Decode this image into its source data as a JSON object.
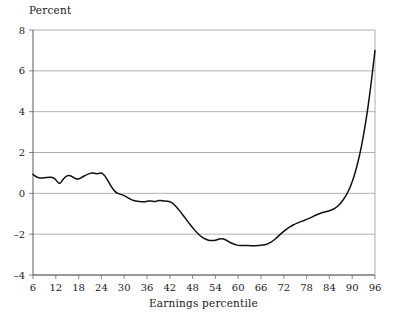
{
  "chart_data": {
    "type": "line",
    "title": "",
    "xlabel": "Earnings percentile",
    "ylabel": "Percent",
    "xlim": [
      6,
      96
    ],
    "ylim": [
      -4,
      8
    ],
    "xticks": [
      6,
      12,
      18,
      24,
      30,
      36,
      42,
      48,
      54,
      60,
      66,
      72,
      78,
      84,
      90,
      96
    ],
    "yticks": [
      -4,
      -2,
      0,
      2,
      4,
      6,
      8
    ],
    "grid": "horizontal",
    "legend": "none",
    "series": [
      {
        "name": "Percent change by earnings percentile",
        "x": [
          6,
          7,
          8,
          9,
          10,
          11,
          12,
          13,
          14,
          15,
          16,
          17,
          18,
          19,
          20,
          21,
          22,
          23,
          24,
          25,
          26,
          27,
          28,
          29,
          30,
          31,
          32,
          33,
          34,
          35,
          36,
          37,
          38,
          39,
          40,
          41,
          42,
          43,
          44,
          45,
          46,
          47,
          48,
          49,
          50,
          51,
          52,
          53,
          54,
          55,
          56,
          57,
          58,
          59,
          60,
          61,
          62,
          63,
          64,
          65,
          66,
          67,
          68,
          69,
          70,
          71,
          72,
          73,
          74,
          75,
          76,
          77,
          78,
          79,
          80,
          81,
          82,
          83,
          84,
          85,
          86,
          87,
          88,
          89,
          90,
          91,
          92,
          93,
          94,
          95,
          96
        ],
        "y": [
          0.93,
          0.78,
          0.75,
          0.76,
          0.78,
          0.8,
          0.68,
          0.42,
          0.72,
          0.88,
          0.86,
          0.73,
          0.68,
          0.8,
          0.9,
          0.98,
          1.0,
          0.95,
          1.02,
          0.85,
          0.52,
          0.2,
          0.02,
          -0.05,
          -0.1,
          -0.22,
          -0.32,
          -0.38,
          -0.4,
          -0.42,
          -0.4,
          -0.36,
          -0.42,
          -0.34,
          -0.36,
          -0.38,
          -0.4,
          -0.52,
          -0.72,
          -0.95,
          -1.2,
          -1.45,
          -1.68,
          -1.9,
          -2.08,
          -2.2,
          -2.3,
          -2.32,
          -2.3,
          -2.24,
          -2.22,
          -2.3,
          -2.42,
          -2.5,
          -2.55,
          -2.56,
          -2.56,
          -2.56,
          -2.57,
          -2.56,
          -2.55,
          -2.52,
          -2.46,
          -2.35,
          -2.2,
          -2.02,
          -1.85,
          -1.72,
          -1.6,
          -1.5,
          -1.42,
          -1.35,
          -1.28,
          -1.2,
          -1.1,
          -1.02,
          -0.95,
          -0.9,
          -0.85,
          -0.78,
          -0.66,
          -0.48,
          -0.22,
          0.1,
          0.55,
          1.15,
          1.9,
          2.85,
          4.0,
          5.4,
          7.0
        ]
      }
    ]
  },
  "axes": {
    "y_title": "Percent",
    "x_title": "Earnings percentile"
  }
}
